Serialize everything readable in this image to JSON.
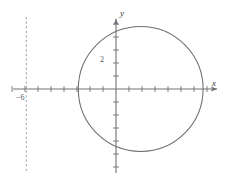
{
  "figure": {
    "width": 229,
    "height": 182,
    "background": "#ffffff",
    "watermark": "",
    "axis_color": "#6e7276",
    "curve_color": "#6b6f73",
    "asymptote_color": "#9aa0a6",
    "label_color": "#3a3a3a"
  },
  "labels": {
    "x_axis": "x",
    "y_axis": "y",
    "y_tick_2": "2",
    "x_tick_neg6": "−6"
  },
  "chart_data": {
    "type": "scatter",
    "title": "",
    "xlabel": "x",
    "ylabel": "y",
    "grid": false,
    "legend": null,
    "axis_style": "arrowed-cartesian",
    "origin_px": [
      116,
      89
    ],
    "unit_px": 13,
    "xlim": [
      -8,
      8
    ],
    "ylim": [
      -5.5,
      5.5
    ],
    "x_ticks": [
      -8,
      -7,
      -6,
      -5,
      -4,
      -3,
      -2,
      -1,
      1,
      2,
      3,
      4,
      5,
      6,
      7
    ],
    "y_ticks": [
      -5,
      -4,
      -3,
      -2,
      -1,
      1,
      2,
      3,
      4,
      5
    ],
    "labeled_x_ticks": [
      {
        "value": -6,
        "label": "−6"
      }
    ],
    "labeled_y_ticks": [
      {
        "value": 2,
        "label": "2"
      }
    ],
    "shapes": [
      {
        "kind": "circle",
        "label": "circle",
        "center": [
          1.9,
          0.0
        ],
        "radius": 4.8,
        "stroke": "#6b6f73",
        "fill": "none",
        "dash": false
      },
      {
        "kind": "vertical-line",
        "label": "asymptote",
        "x": -6.9,
        "stroke": "#9aa0a6",
        "dash": true
      }
    ]
  }
}
